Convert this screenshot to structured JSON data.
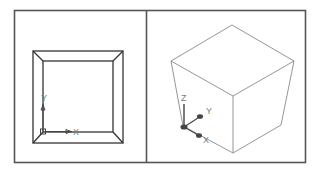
{
  "viewports": [
    {
      "name": "top-view",
      "ucs_labels": {
        "x": "X",
        "y": "Y"
      },
      "square_outer": [
        33,
        51,
        123,
        143
      ],
      "square_inner": [
        43,
        61,
        113,
        132
      ]
    },
    {
      "name": "isometric-view",
      "ucs_labels": {
        "x": "X",
        "y": "Y",
        "z": "Z"
      }
    }
  ],
  "colors": {
    "frame": "#555555",
    "geometry_2d": "#333333",
    "geometry_3d": "#8a8a8a",
    "ucs": "#444444"
  }
}
